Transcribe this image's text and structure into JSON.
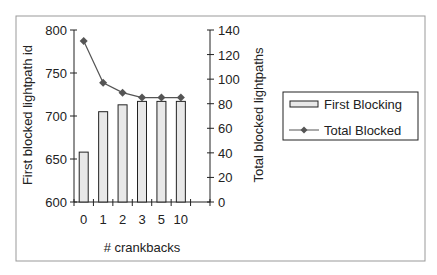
{
  "chart_data": {
    "type": "bar+line",
    "title": "",
    "xlabel": "# crankbacks",
    "ylabel_left": "First blocked lightpath id",
    "ylabel_right": "Total blocked lightpaths",
    "categories": [
      "0",
      "1",
      "2",
      "3",
      "5",
      "10"
    ],
    "ylim_left": [
      600,
      800
    ],
    "yticks_left": [
      "600",
      "650",
      "700",
      "750",
      "800"
    ],
    "ylim_right": [
      0,
      140
    ],
    "yticks_right": [
      "0",
      "20",
      "40",
      "60",
      "80",
      "100",
      "120",
      "140"
    ],
    "series": [
      {
        "name": "First Blocking",
        "type": "bar",
        "axis": "left",
        "values": [
          658,
          705,
          713,
          717,
          717,
          717
        ]
      },
      {
        "name": "Total Blocked",
        "type": "line",
        "axis": "right",
        "values": [
          131,
          97,
          89,
          85,
          85,
          85
        ]
      }
    ],
    "legend": [
      "First Blocking",
      "Total Blocked"
    ],
    "legend_position": "right",
    "grid": false
  },
  "colors": {
    "bar_fill": "#e8e8e8",
    "bar_stroke": "#222222",
    "line": "#555555",
    "marker": "#555555",
    "frame": "#999999"
  }
}
